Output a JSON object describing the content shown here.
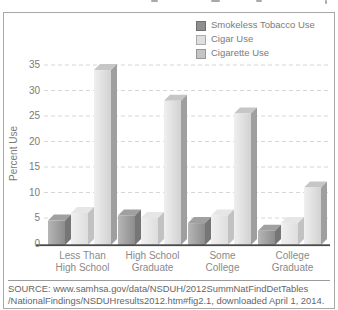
{
  "chart_data": {
    "type": "bar",
    "style": "3d-grayscale-grouped-bars",
    "categories": [
      "Less Than High School",
      "High School Graduate",
      "Some College",
      "College Graduate"
    ],
    "category_label_lines": [
      [
        "Less Than",
        "High School"
      ],
      [
        "High School",
        "Graduate"
      ],
      [
        "Some",
        "College"
      ],
      [
        "College",
        "Graduate"
      ]
    ],
    "series": [
      {
        "name": "Smokeless Tobacco Use",
        "values": [
          4.5,
          5.5,
          4,
          2.5
        ],
        "colors": {
          "front_left": "#b6b6b6",
          "front_right": "#8d8d8d",
          "side": "#767676",
          "top": "#a0a0a0",
          "swatch": "#8f8f8f",
          "swatch_border": "#6f6f6f"
        }
      },
      {
        "name": "Cigar Use",
        "values": [
          6,
          5,
          5.5,
          4
        ],
        "colors": {
          "front_left": "#f0f0f0",
          "front_right": "#dedede",
          "side": "#c2c2c2",
          "top": "#e6e6e6",
          "swatch": "#dfdfdf",
          "swatch_border": "#ababab"
        }
      },
      {
        "name": "Cigarette Use",
        "values": [
          34,
          28,
          25.5,
          11
        ],
        "colors": {
          "front_left": "#efefef",
          "front_right": "#d2d2d2",
          "side": "#9f9f9f",
          "top": "#c6c6c6",
          "swatch": "#c4c4c4",
          "swatch_border": "#979797"
        }
      }
    ],
    "ylabel": "Percent Use",
    "xlabel": "",
    "yticks": [
      0,
      5,
      10,
      15,
      20,
      25,
      30,
      35
    ],
    "ylim": [
      0,
      37
    ],
    "grid": "horizontal-dashed",
    "gridline_color": "#d6d6d6",
    "axis_line_color": "#4a4a4a",
    "legend_position": "top-right"
  },
  "footer": {
    "source_line1": "SOURCE: www.samhsa.gov/data/NSDUH/2012SummNatFindDetTables",
    "source_line2": "/NationalFindings/NSDUHresults2012.htm#fig2.1, downloaded April 1, 2014."
  }
}
